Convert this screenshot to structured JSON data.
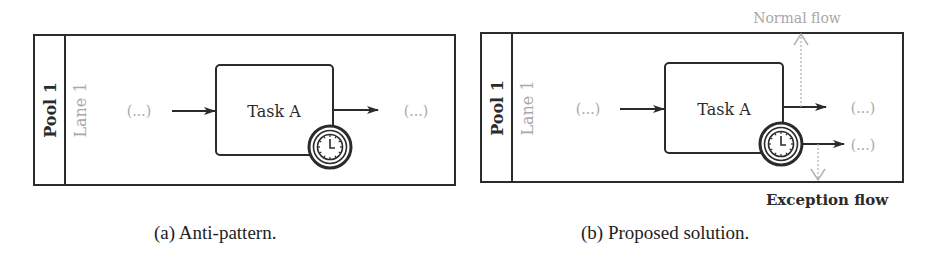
{
  "panels": [
    {
      "id": "a",
      "pool_label": "Pool 1",
      "lane_label": "Lane 1",
      "task_label": "Task A",
      "left_ellipsis": "(...)",
      "right_ellipsis": "(...)",
      "caption": "(a) Anti-pattern."
    },
    {
      "id": "b",
      "pool_label": "Pool 1",
      "lane_label": "Lane 1",
      "task_label": "Task A",
      "left_ellipsis": "(...)",
      "right_ellipsis_top": "(...)",
      "right_ellipsis_bottom": "(...)",
      "normal_flow_label": "Normal flow",
      "exception_flow_label": "Exception flow",
      "caption": "(b) Proposed solution."
    }
  ],
  "colors": {
    "stroke": "#2b2b2b",
    "muted_text": "#a8a8a8",
    "dotted": "#b0b0b0"
  },
  "icons": {
    "timer": "timer-clock-icon"
  }
}
